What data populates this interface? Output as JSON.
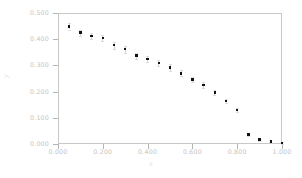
{
  "chart_data": {
    "type": "scatter",
    "title": "",
    "xlabel": "x",
    "ylabel": "y",
    "xlim": [
      0.0,
      1.0
    ],
    "ylim": [
      0.0,
      0.5
    ],
    "grid": false,
    "legend": null,
    "marker": "square",
    "marker_color": "#121212",
    "errorbars": true,
    "xticks": [
      "0.000",
      "0.200",
      "0.400",
      "0.600",
      "0.800",
      "1.000"
    ],
    "xtick_values": [
      0.0,
      0.2,
      0.4,
      0.6,
      0.8,
      1.0
    ],
    "yticks": [
      "0.000",
      "0.100",
      "0.200",
      "0.300",
      "0.400",
      "0.500"
    ],
    "ytick_values": [
      0.0,
      0.1,
      0.2,
      0.3,
      0.4,
      0.5
    ],
    "x": [
      0.05,
      0.1,
      0.15,
      0.2,
      0.25,
      0.3,
      0.35,
      0.4,
      0.45,
      0.5,
      0.55,
      0.6,
      0.65,
      0.7,
      0.75,
      0.8,
      0.85,
      0.9,
      0.95,
      1.0
    ],
    "values": [
      0.449,
      0.425,
      0.412,
      0.405,
      0.377,
      0.362,
      0.337,
      0.324,
      0.31,
      0.292,
      0.27,
      0.246,
      0.225,
      0.196,
      0.164,
      0.129,
      0.036,
      0.018,
      0.01,
      0.004
    ],
    "yerr": [
      0.012,
      0.011,
      0.012,
      0.013,
      0.013,
      0.013,
      0.012,
      0.012,
      0.012,
      0.012,
      0.011,
      0.011,
      0.01,
      0.01,
      0.009,
      0.008,
      0.006,
      0.005,
      0.004,
      0.003
    ]
  },
  "axes": {
    "x_title": "x",
    "y_title": "y"
  }
}
